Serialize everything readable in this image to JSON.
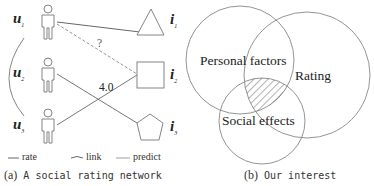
{
  "left_panel": {
    "users": [
      {
        "label": "u",
        "sub": "1"
      },
      {
        "label": "u",
        "sub": "2"
      },
      {
        "label": "u",
        "sub": "3"
      }
    ],
    "items": [
      {
        "label": "i",
        "sub": "1",
        "shape": "triangle"
      },
      {
        "label": "i",
        "sub": "2",
        "shape": "square"
      },
      {
        "label": "i",
        "sub": "3",
        "shape": "pentagon"
      }
    ],
    "edge_labels": {
      "predict": "?",
      "rate": "4.0"
    },
    "legend": [
      {
        "key": "rate",
        "label": "rate"
      },
      {
        "key": "link",
        "label": "link"
      },
      {
        "key": "predict",
        "label": "predict"
      }
    ],
    "caption": {
      "prefix": "(a)",
      "text": "A social rating network"
    }
  },
  "right_panel": {
    "sets": [
      {
        "label": "Personal factors"
      },
      {
        "label": "Rating"
      },
      {
        "label": "Social effects"
      }
    ],
    "caption": {
      "prefix": "(b)",
      "text": "Our interest"
    }
  },
  "colors": {
    "line": "#555555",
    "predict": "#888888",
    "stroke": "#777777"
  }
}
